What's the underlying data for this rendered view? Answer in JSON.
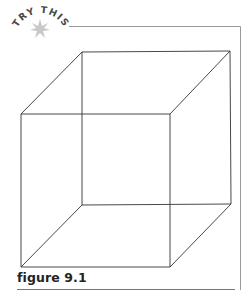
{
  "badge": {
    "label": "TRY THIS",
    "icon": "star-burst-icon",
    "text_color": "#4a4a4a",
    "star_color": "#c8c8c8"
  },
  "figure": {
    "caption": "figure 9.1",
    "line_color": "#333333",
    "frame_color": "#9a9a9a"
  }
}
